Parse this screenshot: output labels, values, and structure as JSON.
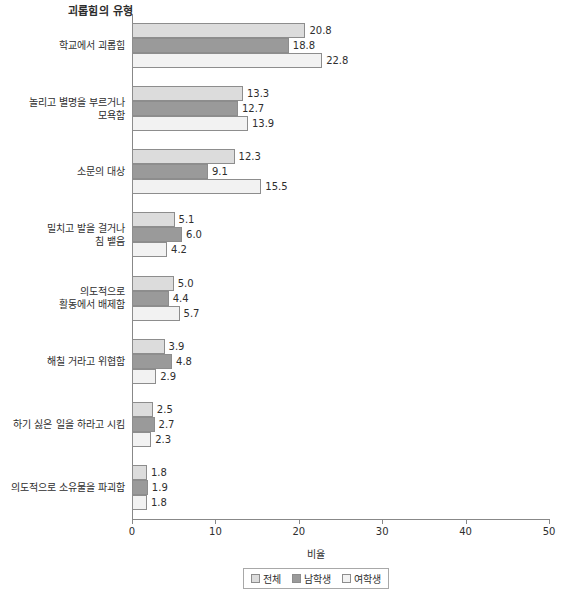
{
  "chart_data": {
    "type": "bar",
    "orientation": "horizontal",
    "title": "괴롭힘의 유형",
    "xlabel": "비율",
    "ylabel": "",
    "xlim": [
      0,
      50
    ],
    "xticks": [
      0,
      10,
      20,
      30,
      40,
      50
    ],
    "grid": false,
    "legend_position": "bottom",
    "categories": [
      "학교에서 괴롭힘",
      "놀리고 별명을 부르거나\n모욕함",
      "소문의 대상",
      "밀치고 발을 걸거나\n침 뱉음",
      "의도적으로\n활동에서 배제함",
      "해칠 거라고 위협함",
      "하기 싫은 일을 하라고 시킴",
      "의도적으로 소유물을 파괴함"
    ],
    "series": [
      {
        "name": "전체",
        "color": "#dcdcdc",
        "values": [
          20.8,
          13.3,
          12.3,
          5.1,
          5.0,
          3.9,
          2.5,
          1.8
        ]
      },
      {
        "name": "남학생",
        "color": "#9a9a9a",
        "values": [
          18.8,
          12.7,
          9.1,
          6.0,
          4.4,
          4.8,
          2.7,
          1.9
        ]
      },
      {
        "name": "여학생",
        "color": "#f2f2f2",
        "values": [
          22.8,
          13.9,
          15.5,
          4.2,
          5.7,
          2.9,
          2.3,
          1.8
        ]
      }
    ]
  },
  "legend": {
    "items": [
      "전체",
      "남학생",
      "여학생"
    ]
  },
  "bottom_caption": ""
}
